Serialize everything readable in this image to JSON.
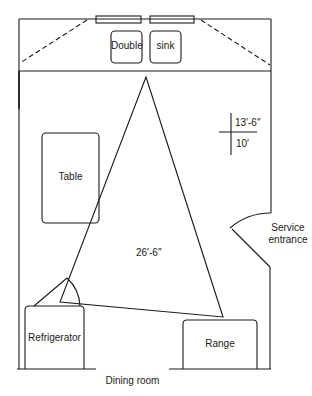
{
  "diagram": {
    "type": "kitchen-floor-plan",
    "work_triangle": {
      "vertices": [
        "sink",
        "refrigerator",
        "range"
      ],
      "total_length_label": "26′-6″"
    },
    "room_dimensions": {
      "length": "13′-6″",
      "width": "10′"
    },
    "fixtures": {
      "sink_left_label": "Double",
      "sink_right_label": "sink",
      "table_label": "Table",
      "refrigerator_label": "Refrigerator",
      "range_label": "Range"
    },
    "openings": {
      "service_entrance_line1": "Service",
      "service_entrance_line2": "entrance",
      "dining_room_label": "Dining room"
    },
    "colors": {
      "line": "#1a1a1a",
      "background": "#ffffff"
    }
  }
}
